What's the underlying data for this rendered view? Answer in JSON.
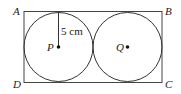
{
  "diagram": {
    "type": "geometry",
    "vertices": {
      "A": "A",
      "B": "B",
      "C": "C",
      "D": "D"
    },
    "centres": {
      "P": "P",
      "Q": "Q"
    },
    "radius_label": "5 cm",
    "colors": {
      "stroke": "#333333",
      "text": "#222222",
      "background": "#ffffff"
    }
  }
}
